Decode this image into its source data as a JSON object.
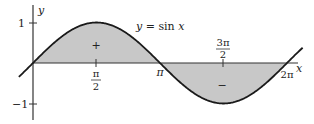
{
  "chart_data": {
    "type": "area",
    "title": "",
    "function_label": "y = sin x",
    "xlabel": "x",
    "ylabel": "y",
    "x_ticks": [
      {
        "value": 1.5708,
        "label_num": "π",
        "label_den": "2",
        "position": "below"
      },
      {
        "value": 3.1416,
        "label": "π",
        "position": "below"
      },
      {
        "value": 4.7124,
        "label_num": "3π",
        "label_den": "2",
        "position": "above"
      },
      {
        "value": 6.2832,
        "label": "2π",
        "position": "below"
      }
    ],
    "y_ticks": [
      {
        "value": 1,
        "label": "1"
      },
      {
        "value": -1,
        "label": "−1"
      }
    ],
    "xlim": [
      -0.5,
      6.9
    ],
    "ylim": [
      -1.4,
      1.3
    ],
    "series": [
      {
        "name": "sin x",
        "x": [
          0,
          0.785,
          1.571,
          2.356,
          3.142,
          3.927,
          4.712,
          5.498,
          6.283
        ],
        "values": [
          0,
          0.707,
          1,
          0.707,
          0,
          -0.707,
          -1,
          -0.707,
          0
        ]
      }
    ],
    "shaded_regions": [
      {
        "from": 0,
        "to": 3.1416,
        "sign_label": "+"
      },
      {
        "from": 3.1416,
        "to": 6.2832,
        "sign_label": "−"
      }
    ],
    "colors": {
      "fill": "#c8c8c8",
      "curve": "#1a1a1a",
      "axis": "#333333"
    },
    "grid": false,
    "legend": "none"
  },
  "labels": {
    "function": "y = sin x",
    "x_axis": "x",
    "y_axis": "y",
    "y_tick_pos": "1",
    "y_tick_neg": "−1",
    "pi_half_num": "π",
    "pi_half_den": "2",
    "pi": "π",
    "three_pi_half_num": "3π",
    "three_pi_half_den": "2",
    "two_pi": "2π",
    "plus_sign": "+",
    "minus_sign": "−"
  }
}
